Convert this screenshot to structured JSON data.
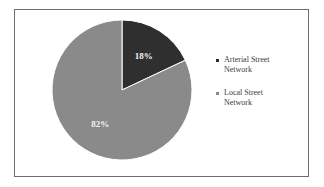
{
  "chart_data": {
    "type": "pie",
    "title": "",
    "categories": [
      "Arterial Street Network",
      "Local Street Network"
    ],
    "values": [
      18,
      82
    ],
    "labels": [
      "18%",
      "82%"
    ],
    "colors": [
      "#2f2f2f",
      "#8a8a8a"
    ],
    "legend_position": "right",
    "start_angle_deg": 0,
    "direction": "clockwise"
  },
  "legend": {
    "items": [
      {
        "label_line1": "Arterial Street",
        "label_line2": "Network",
        "color": "#2f2f2f"
      },
      {
        "label_line1": "Local Street",
        "label_line2": "Network",
        "color": "#8a8a8a"
      }
    ]
  }
}
